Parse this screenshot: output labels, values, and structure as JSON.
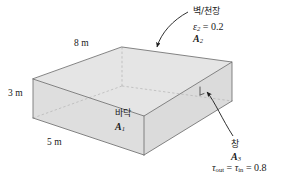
{
  "figure": {
    "kind": "room-enclosure-diagram",
    "dimensions": {
      "length_label": "8 m",
      "height_label": "3 m",
      "width_label": "5 m"
    },
    "surfaces": {
      "floor": {
        "name_korean": "바닥",
        "area_symbol": "A",
        "area_index": "1"
      },
      "wall_ceiling": {
        "name_korean": "벽/천장",
        "emissivity_symbol": "ε",
        "emissivity_index": "2",
        "emissivity_eq": " = 0.2",
        "area_symbol": "A",
        "area_index": "2"
      },
      "window": {
        "name_korean": "창",
        "area_symbol": "A",
        "area_index": "3",
        "tau_symbol": "τ",
        "tau_out_index": "out",
        "tau_mid_eq": " = ",
        "tau_in_index": "in",
        "tau_value_eq": " = 0.8"
      }
    },
    "colors": {
      "top_face": "#e3e3e3",
      "front_face": "#e0e0e0",
      "left_face": "#dcdcdc",
      "right_face": "#d9d9d9",
      "edge": "#6b6b6b",
      "hidden_edge": "#b0b0b0",
      "text": "#1a1a1a",
      "background": "#ffffff"
    }
  }
}
